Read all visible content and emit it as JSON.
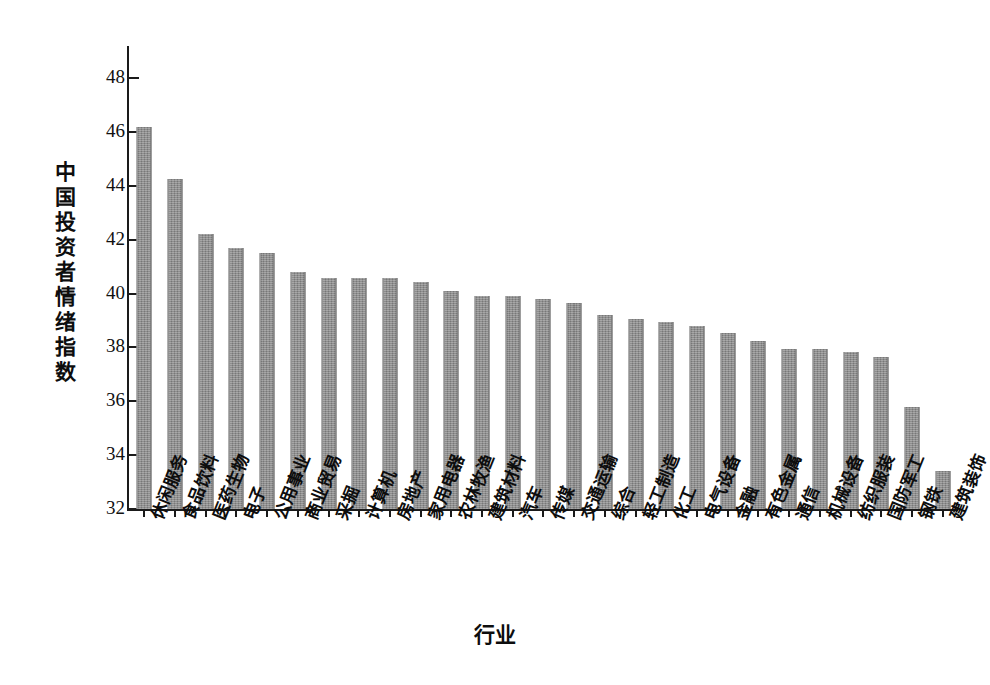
{
  "chart_data": {
    "type": "bar",
    "title": "",
    "xlabel": "行业",
    "ylabel": "中国投资者情绪指数",
    "ylim": [
      32,
      49.2
    ],
    "yticks": [
      32,
      34,
      36,
      38,
      40,
      42,
      44,
      46,
      48
    ],
    "grid": false,
    "legend": null,
    "orientation": "vertical",
    "bar_color": "#8b8b8b",
    "categories": [
      "休闲服务",
      "食品饮料",
      "医药生物",
      "电子",
      "公用事业",
      "商业贸易",
      "采掘",
      "计算机",
      "房地产",
      "家用电器",
      "农林牧渔",
      "建筑材料",
      "汽车",
      "传媒",
      "交通运输",
      "综合",
      "轻工制造",
      "化工",
      "电气设备",
      "金融",
      "有色金属",
      "通信",
      "机械设备",
      "纺织服装",
      "国防军工",
      "钢铁",
      "建筑装饰"
    ],
    "values": [
      46.2,
      44.25,
      42.2,
      41.7,
      41.5,
      40.8,
      40.6,
      40.6,
      40.6,
      40.45,
      40.1,
      39.9,
      39.9,
      39.8,
      39.65,
      39.2,
      39.05,
      38.95,
      38.8,
      38.55,
      38.25,
      37.95,
      37.95,
      37.85,
      37.65,
      35.8,
      33.4
    ]
  },
  "axis": {
    "y_title": "中国投资者情绪指数",
    "x_title": "行业"
  }
}
